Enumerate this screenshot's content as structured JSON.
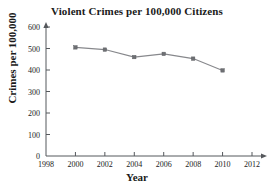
{
  "chart_data": {
    "type": "line",
    "title": "Violent Crimes per 100,000 Citizens",
    "xlabel": "Year",
    "ylabel": "Crimes per 100,000",
    "x": [
      2000,
      2002,
      2004,
      2006,
      2008,
      2010
    ],
    "values": [
      505,
      495,
      460,
      475,
      453,
      398
    ],
    "series": [
      {
        "name": "Violent crime rate",
        "values": [
          505,
          495,
          460,
          475,
          453,
          398
        ]
      }
    ],
    "xlim": [
      1998,
      2012
    ],
    "ylim": [
      0,
      640
    ],
    "xticks": [
      1998,
      2000,
      2002,
      2004,
      2006,
      2008,
      2010,
      2012
    ],
    "yticks": [
      0,
      100,
      200,
      300,
      400,
      500,
      600
    ],
    "xtick_labels": [
      "1998",
      "2000",
      "2002",
      "2004",
      "2006",
      "2008",
      "2010",
      "2012"
    ],
    "ytick_labels": [
      "0",
      "100",
      "200",
      "300",
      "400",
      "500",
      "600"
    ],
    "grid": false,
    "legend": "none",
    "marker": "square",
    "line_color": "#87888c",
    "marker_color": "#6e7074",
    "axis_color": "#55585c",
    "background": "#ffffff"
  }
}
